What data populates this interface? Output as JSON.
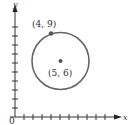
{
  "diagram": {
    "type": "coordinate-plane-circle",
    "axes": {
      "x_label": "x",
      "y_label": "y",
      "origin_label": "0",
      "x_ticks": 11,
      "y_ticks": 10
    },
    "circle": {
      "center": {
        "x": 5,
        "y": 6,
        "label": "(5, 6)"
      },
      "point_on_circle": {
        "x": 4,
        "y": 9,
        "label": "(4, 9)"
      },
      "radius": "√10"
    },
    "colors": {
      "axis": "#333333",
      "circle": "#666666",
      "points": "#555555"
    }
  }
}
